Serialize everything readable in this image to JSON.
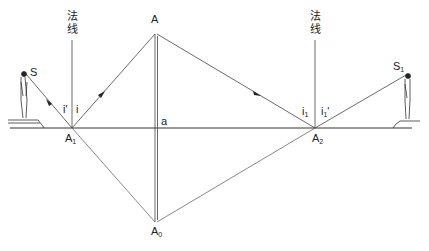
{
  "diagram": {
    "type": "optics-reflection",
    "labels": {
      "A": "A",
      "a": "a",
      "A0": "A",
      "A0_sub": "0",
      "A1": "A",
      "A1_sub": "1",
      "A2": "A",
      "A2_sub": "2",
      "S": "S",
      "S1": "S",
      "S1_sub": "1",
      "i_left": "i",
      "i_prime_left": "i'",
      "i1": "i",
      "i1_sub": "1",
      "i1_prime": "i",
      "i1_prime_sub": "1",
      "i1_prime_mark": "'"
    },
    "normal_left": [
      "法",
      "线"
    ],
    "normal_right": [
      "法",
      "线"
    ],
    "colors": {
      "line": "#333333",
      "background": "#ffffff"
    }
  }
}
